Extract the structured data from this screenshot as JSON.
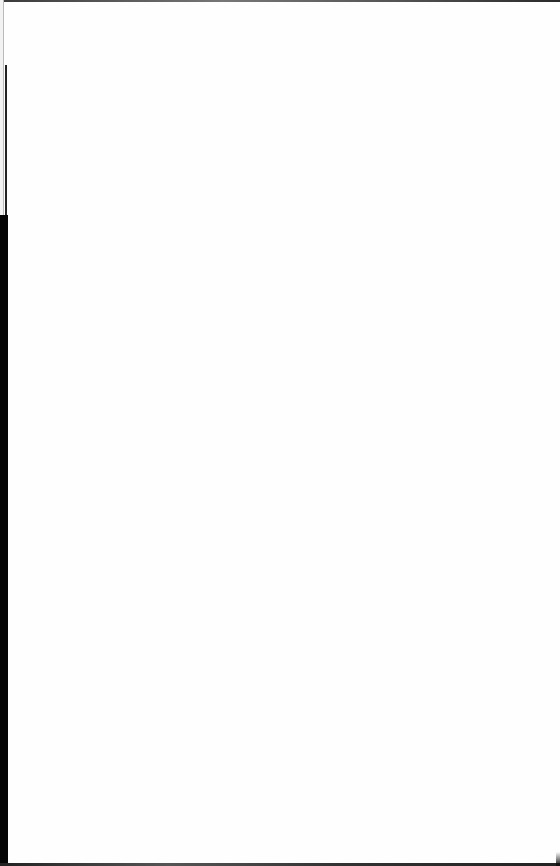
{
  "document": {
    "type": "blank scanned page",
    "text_content": [],
    "colors": {
      "paper": "#fefefe",
      "scan_edge": "#050505"
    }
  }
}
